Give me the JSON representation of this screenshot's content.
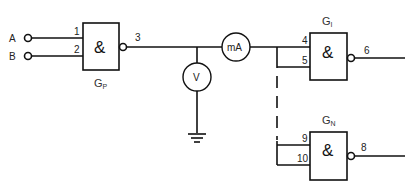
{
  "diagram": {
    "type": "logic-circuit",
    "inputs": [
      {
        "label": "A",
        "pin": "1"
      },
      {
        "label": "B",
        "pin": "2"
      }
    ],
    "gates": [
      {
        "id": "GP",
        "name": "G",
        "subscript": "P",
        "symbol": "&",
        "inputs": [
          "1",
          "2"
        ],
        "output": "3",
        "inverted_output": true
      },
      {
        "id": "GI",
        "name": "G",
        "subscript": "I",
        "symbol": "&",
        "inputs": [
          "4",
          "5"
        ],
        "output": "6",
        "inverted_output": true
      },
      {
        "id": "GN",
        "name": "G",
        "subscript": "N",
        "symbol": "&",
        "inputs": [
          "9",
          "10"
        ],
        "output": "8",
        "inverted_output": true
      }
    ],
    "meters": [
      {
        "id": "ammeter",
        "label": "mA"
      },
      {
        "id": "voltmeter",
        "label": "V"
      }
    ],
    "ground": "ground-symbol"
  },
  "labels": {
    "A": "A",
    "B": "B",
    "pin1": "1",
    "pin2": "2",
    "pin3": "3",
    "pin4": "4",
    "pin5": "5",
    "pin6": "6",
    "pin8": "8",
    "pin9": "9",
    "pin10": "10",
    "and": "&",
    "G": "G",
    "gp_sub": "P",
    "gi_sub": "I",
    "gn_sub": "N",
    "mA": "mA",
    "V": "V"
  }
}
